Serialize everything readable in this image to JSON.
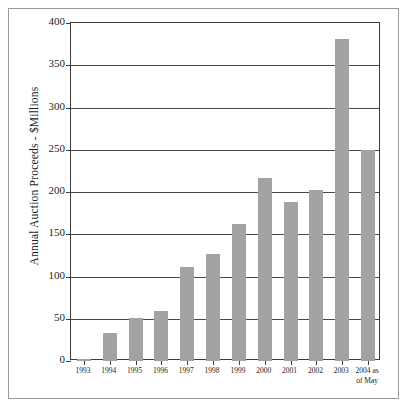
{
  "chart_data": {
    "type": "bar",
    "title": "",
    "xlabel": "",
    "ylabel": "Annual Auction Proceeds - $Millions",
    "ylim": [
      0,
      400
    ],
    "ytick_labels": [
      "0",
      "50",
      "100",
      "150",
      "200",
      "250",
      "300",
      "350",
      "400"
    ],
    "yticks": [
      0,
      50,
      100,
      150,
      200,
      250,
      300,
      350,
      400
    ],
    "grid": "horizontal",
    "legend": "none",
    "bar_color": "#a3a3a3",
    "categories": [
      "1993",
      "1994",
      "1995",
      "1996",
      "1997",
      "1998",
      "1999",
      "2000",
      "2001",
      "2002",
      "2003",
      "2004 as of May"
    ],
    "category_labels": [
      {
        "line1": "1993",
        "line2": ""
      },
      {
        "line1": "1994",
        "line2": ""
      },
      {
        "line1": "1995",
        "line2": ""
      },
      {
        "line1": "1996",
        "line2": ""
      },
      {
        "line1": "1997",
        "line2": ""
      },
      {
        "line1": "1998",
        "line2": ""
      },
      {
        "line1": "1999",
        "line2": ""
      },
      {
        "line1": "2000",
        "line2": ""
      },
      {
        "line1": "2001",
        "line2": ""
      },
      {
        "line1": "2002",
        "line2": ""
      },
      {
        "line1": "2003",
        "line2": ""
      },
      {
        "line1": "2004 as",
        "line2": "of May"
      }
    ],
    "values": [
      2,
      33,
      51,
      59,
      111,
      127,
      162,
      216,
      188,
      202,
      381,
      250
    ]
  }
}
